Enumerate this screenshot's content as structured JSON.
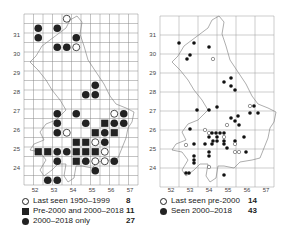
{
  "left_map": {
    "y_ticks": [
      "31",
      "30",
      "29",
      "28",
      "27",
      "26",
      "25",
      "24"
    ],
    "x_ticks": [
      "52",
      "53",
      "54",
      "55",
      "56",
      "57"
    ],
    "legend": [
      {
        "symbol": "open-circle",
        "label": "Last seen 1950–1999",
        "count": "8"
      },
      {
        "symbol": "filled-square",
        "label": "Pre-2000 and 2000–2018",
        "count": "11"
      },
      {
        "symbol": "filled-circle",
        "label": "2000–2018 only",
        "count": "27"
      }
    ],
    "cells": [
      {
        "c": 4,
        "r": 1,
        "t": "open"
      },
      {
        "c": 1,
        "r": 2,
        "t": "filled"
      },
      {
        "c": 3,
        "r": 2,
        "t": "filled"
      },
      {
        "c": 1,
        "r": 3,
        "t": "filled"
      },
      {
        "c": 5,
        "r": 3,
        "t": "filled"
      },
      {
        "c": 3,
        "r": 4,
        "t": "filled"
      },
      {
        "c": 4,
        "r": 4,
        "t": "filled"
      },
      {
        "c": 5,
        "r": 4,
        "t": "open"
      },
      {
        "c": 7,
        "r": 8,
        "t": "filled"
      },
      {
        "c": 6,
        "r": 9,
        "t": "filled"
      },
      {
        "c": 7,
        "r": 9,
        "t": "filled"
      },
      {
        "c": 3,
        "r": 11,
        "t": "filled"
      },
      {
        "c": 5,
        "r": 11,
        "t": "filled"
      },
      {
        "c": 9,
        "r": 11,
        "t": "open"
      },
      {
        "c": 10,
        "r": 11,
        "t": "filled"
      },
      {
        "c": 3,
        "r": 12,
        "t": "filled"
      },
      {
        "c": 6,
        "r": 12,
        "t": "filled"
      },
      {
        "c": 8,
        "r": 12,
        "t": "square"
      },
      {
        "c": 9,
        "r": 12,
        "t": "filled"
      },
      {
        "c": 10,
        "r": 12,
        "t": "filled"
      },
      {
        "c": 3,
        "r": 13,
        "t": "filled"
      },
      {
        "c": 4,
        "r": 13,
        "t": "open"
      },
      {
        "c": 7,
        "r": 13,
        "t": "square"
      },
      {
        "c": 8,
        "r": 13,
        "t": "filled"
      },
      {
        "c": 9,
        "r": 13,
        "t": "square"
      },
      {
        "c": 5,
        "r": 14,
        "t": "square"
      },
      {
        "c": 6,
        "r": 14,
        "t": "square"
      },
      {
        "c": 7,
        "r": 14,
        "t": "open"
      },
      {
        "c": 8,
        "r": 14,
        "t": "filled"
      },
      {
        "c": 1,
        "r": 15,
        "t": "square"
      },
      {
        "c": 2,
        "r": 15,
        "t": "square"
      },
      {
        "c": 3,
        "r": 15,
        "t": "filled"
      },
      {
        "c": 4,
        "r": 15,
        "t": "filled"
      },
      {
        "c": 5,
        "r": 15,
        "t": "square"
      },
      {
        "c": 6,
        "r": 15,
        "t": "square"
      },
      {
        "c": 7,
        "r": 15,
        "t": "square"
      },
      {
        "c": 8,
        "r": 15,
        "t": "open"
      },
      {
        "c": 3,
        "r": 16,
        "t": "filled"
      },
      {
        "c": 5,
        "r": 16,
        "t": "square"
      },
      {
        "c": 6,
        "r": 16,
        "t": "filled"
      },
      {
        "c": 7,
        "r": 16,
        "t": "open"
      },
      {
        "c": 8,
        "r": 16,
        "t": "open"
      },
      {
        "c": 9,
        "r": 16,
        "t": "filled"
      },
      {
        "c": 7,
        "r": 17,
        "t": "filled"
      },
      {
        "c": 2,
        "r": 18,
        "t": "filled"
      },
      {
        "c": 3,
        "r": 18,
        "t": "filled"
      }
    ]
  },
  "right_map": {
    "y_ticks": [
      "31",
      "30",
      "29",
      "28",
      "27",
      "26",
      "25",
      "24"
    ],
    "x_ticks": [
      "52",
      "53",
      "54",
      "55",
      "56",
      "57"
    ],
    "legend": [
      {
        "symbol": "open-circle",
        "label": "Last seen pre-2000",
        "count": "14"
      },
      {
        "symbol": "filled-circle",
        "label": "Seen 2000–2018",
        "count": "43"
      }
    ],
    "points": [
      {
        "x": 179,
        "y": 43,
        "t": "filled"
      },
      {
        "x": 194,
        "y": 43,
        "t": "filled"
      },
      {
        "x": 209,
        "y": 47,
        "t": "filled"
      },
      {
        "x": 190,
        "y": 55,
        "t": "filled"
      },
      {
        "x": 187,
        "y": 59,
        "t": "filled"
      },
      {
        "x": 213,
        "y": 59,
        "t": "open"
      },
      {
        "x": 224,
        "y": 82,
        "t": "filled"
      },
      {
        "x": 231,
        "y": 78,
        "t": "filled"
      },
      {
        "x": 231,
        "y": 86,
        "t": "filled"
      },
      {
        "x": 235,
        "y": 90,
        "t": "filled"
      },
      {
        "x": 197,
        "y": 110,
        "t": "filled"
      },
      {
        "x": 209,
        "y": 110,
        "t": "filled"
      },
      {
        "x": 217,
        "y": 107,
        "t": "filled"
      },
      {
        "x": 250,
        "y": 106,
        "t": "open"
      },
      {
        "x": 254,
        "y": 106,
        "t": "filled"
      },
      {
        "x": 250,
        "y": 113,
        "t": "filled"
      },
      {
        "x": 258,
        "y": 113,
        "t": "filled"
      },
      {
        "x": 231,
        "y": 118,
        "t": "filled"
      },
      {
        "x": 238,
        "y": 116,
        "t": "filled"
      },
      {
        "x": 227,
        "y": 125,
        "t": "open"
      },
      {
        "x": 239,
        "y": 125,
        "t": "filled"
      },
      {
        "x": 235,
        "y": 121,
        "t": "filled"
      },
      {
        "x": 190,
        "y": 129,
        "t": "filled"
      },
      {
        "x": 205,
        "y": 130,
        "t": "open"
      },
      {
        "x": 209,
        "y": 133,
        "t": "open"
      },
      {
        "x": 212,
        "y": 133,
        "t": "filled"
      },
      {
        "x": 216,
        "y": 133,
        "t": "filled"
      },
      {
        "x": 220,
        "y": 133,
        "t": "filled"
      },
      {
        "x": 224,
        "y": 133,
        "t": "filled"
      },
      {
        "x": 209,
        "y": 137,
        "t": "filled"
      },
      {
        "x": 217,
        "y": 137,
        "t": "filled"
      },
      {
        "x": 224,
        "y": 137,
        "t": "open"
      },
      {
        "x": 244,
        "y": 137,
        "t": "filled"
      },
      {
        "x": 213,
        "y": 141,
        "t": "filled"
      },
      {
        "x": 217,
        "y": 141,
        "t": "filled"
      },
      {
        "x": 224,
        "y": 141,
        "t": "filled"
      },
      {
        "x": 235,
        "y": 141,
        "t": "filled"
      },
      {
        "x": 186,
        "y": 145,
        "t": "open"
      },
      {
        "x": 194,
        "y": 144,
        "t": "filled"
      },
      {
        "x": 205,
        "y": 144,
        "t": "filled"
      },
      {
        "x": 212,
        "y": 144,
        "t": "filled"
      },
      {
        "x": 224,
        "y": 144,
        "t": "filled"
      },
      {
        "x": 235,
        "y": 144,
        "t": "open"
      },
      {
        "x": 209,
        "y": 152,
        "t": "filled"
      },
      {
        "x": 227,
        "y": 148,
        "t": "filled"
      },
      {
        "x": 209,
        "y": 156,
        "t": "filled"
      },
      {
        "x": 235,
        "y": 152,
        "t": "open"
      },
      {
        "x": 239,
        "y": 152,
        "t": "open"
      },
      {
        "x": 246,
        "y": 152,
        "t": "filled"
      },
      {
        "x": 194,
        "y": 156,
        "t": "filled"
      },
      {
        "x": 194,
        "y": 160,
        "t": "filled"
      },
      {
        "x": 194,
        "y": 163,
        "t": "filled"
      },
      {
        "x": 209,
        "y": 167,
        "t": "open"
      },
      {
        "x": 224,
        "y": 175,
        "t": "filled"
      },
      {
        "x": 186,
        "y": 173,
        "t": "filled"
      },
      {
        "x": 189,
        "y": 173,
        "t": "filled"
      }
    ]
  }
}
